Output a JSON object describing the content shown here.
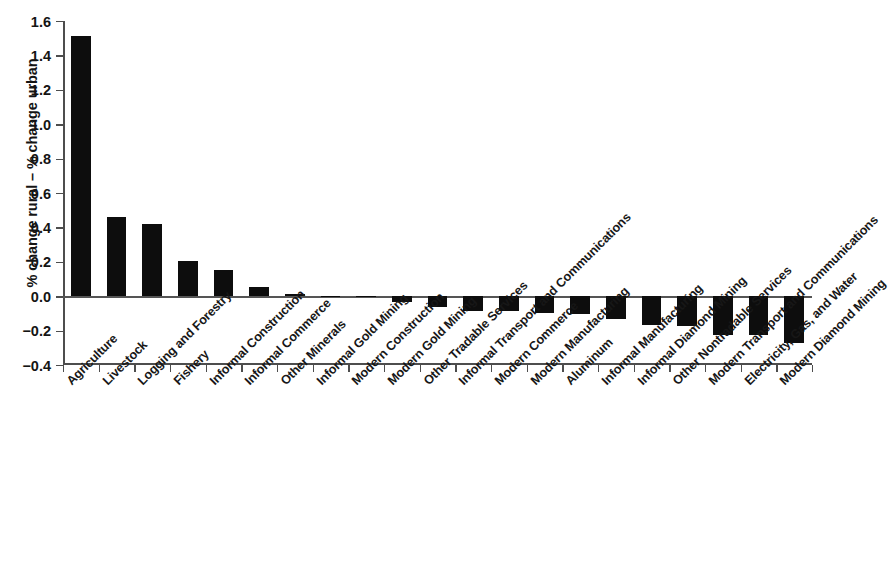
{
  "chart_data": {
    "type": "bar",
    "title": "",
    "xlabel": "",
    "ylabel": "% change rural – % change urban",
    "ylim": [
      -0.4,
      1.6
    ],
    "ytick_labels": [
      "1.6",
      "1.4",
      "1.2",
      "1.0",
      "0.8",
      "0.6",
      "0.4",
      "0.2",
      "0.0",
      "−0.2",
      "−0.4"
    ],
    "ytick_values": [
      1.6,
      1.4,
      1.2,
      1.0,
      0.8,
      0.6,
      0.4,
      0.2,
      0.0,
      -0.2,
      -0.4
    ],
    "grid": false,
    "legend": null,
    "bar_color": "#0d0d0d",
    "categories": [
      "Agriculture",
      "Livestock",
      "Logging and Forestry",
      "Fishery",
      "Informal Construction",
      "Informal Commerce",
      "Other Minerals",
      "Informal Gold Mining",
      "Modern Construction",
      "Modern Gold Mining",
      "Other Tradable Services",
      "Informal Transport and Communications",
      "Modern Commerce",
      "Modern Manufacturing",
      "Aluminum",
      "Informal Manufacturing",
      "Informal Diamond Mining",
      "Other Nontradable Services",
      "Modern Transport and Communications",
      "Electricity, Gas, and Water",
      "Modern Diamond Mining"
    ],
    "values": [
      1.51,
      0.46,
      0.42,
      0.205,
      0.155,
      0.055,
      0.01,
      0.0,
      -0.005,
      -0.035,
      -0.06,
      -0.085,
      -0.085,
      -0.095,
      -0.105,
      -0.13,
      -0.165,
      -0.175,
      -0.225,
      -0.225,
      -0.275
    ]
  }
}
